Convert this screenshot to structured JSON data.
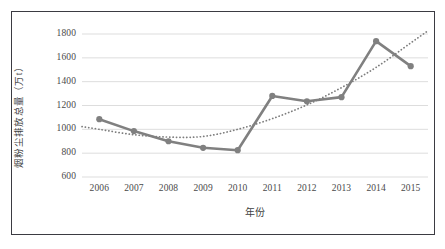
{
  "chart_data": {
    "type": "line",
    "title": "",
    "xlabel": "年份",
    "ylabel": "烟粉尘排放总量（万t）",
    "categories": [
      "2006",
      "2007",
      "2008",
      "2009",
      "2010",
      "2011",
      "2012",
      "2013",
      "2014",
      "2015"
    ],
    "series": [
      {
        "name": "烟粉尘排放总量",
        "style": "solid-line-with-markers",
        "color": "#808080",
        "values": [
          1085,
          985,
          900,
          845,
          825,
          1280,
          1235,
          1270,
          1740,
          1530
        ]
      },
      {
        "name": "趋势线",
        "style": "dotted-trendline",
        "color": "#7d7d7d",
        "values": [
          1000,
          955,
          935,
          940,
          1000,
          1090,
          1205,
          1350,
          1520,
          1725
        ]
      }
    ],
    "ylim": [
      600,
      1800
    ],
    "yticks": [
      600,
      800,
      1000,
      1200,
      1400,
      1600,
      1800
    ],
    "ytick_labels": [
      "600",
      "800",
      "1000",
      "1200",
      "1400",
      "1600",
      "1800"
    ],
    "xtick_labels": [
      "2006",
      "2007",
      "2008",
      "2009",
      "2010",
      "2011",
      "2012",
      "2013",
      "2014",
      "2015"
    ],
    "grid": "horizontal",
    "gridline_color": "#d9d9d9",
    "legend": "none",
    "background": "#ffffff",
    "frame_color": "#3b3b42"
  }
}
